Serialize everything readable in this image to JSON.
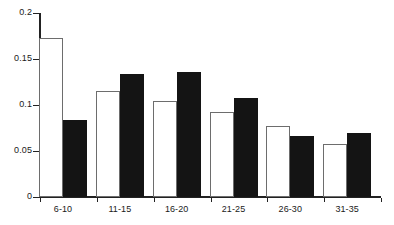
{
  "chart_data": {
    "type": "bar",
    "title": "",
    "subtitle": "",
    "xlabel": "",
    "ylabel": "",
    "categories": [
      "6-10",
      "11-15",
      "16-20",
      "21-25",
      "26-30",
      "31-35"
    ],
    "series": [
      {
        "name": "open",
        "style": "white-filled-with-dark-outline",
        "color": "#ffffff",
        "edge_color": "#6d6d6d",
        "values": [
          0.173,
          0.115,
          0.104,
          0.092,
          0.077,
          0.058
        ]
      },
      {
        "name": "solid",
        "style": "black-filled",
        "color": "#141414",
        "edge_color": "#141414",
        "values": [
          0.084,
          0.134,
          0.136,
          0.108,
          0.066,
          0.07
        ]
      }
    ],
    "ylim": [
      0,
      0.2
    ],
    "ytick_values": [
      0,
      0.05,
      0.1,
      0.15,
      0.2
    ],
    "ytick_labels": [
      "0",
      "0.05",
      "0.1",
      "0.15",
      "0.2"
    ],
    "grid": false,
    "legend": false,
    "legend_position": "none",
    "annotations": []
  },
  "axes": {
    "y_axis_name": "y-axis",
    "x_axis_name": "x-axis"
  }
}
